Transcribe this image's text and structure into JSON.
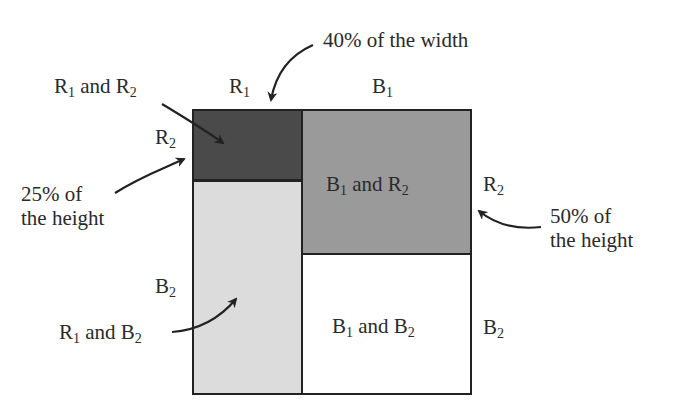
{
  "diagram": {
    "outer_box": {
      "x": 192,
      "y": 109,
      "width": 279,
      "height": 286
    },
    "regions": [
      {
        "id": "r1_r2",
        "label": "",
        "x": 192,
        "y": 109,
        "width": 110,
        "height": 71,
        "fill": "#4a4a4a"
      },
      {
        "id": "r1_b2",
        "label": "",
        "x": 192,
        "y": 180,
        "width": 110,
        "height": 215,
        "fill": "#dcdcdc"
      },
      {
        "id": "b1_r2",
        "label_parts": [
          "B",
          "1",
          " and R",
          "2"
        ],
        "x": 302,
        "y": 109,
        "width": 169,
        "height": 145,
        "fill": "#9a9a9a"
      },
      {
        "id": "b1_b2",
        "label_parts": [
          "B",
          "1",
          " and B",
          "2"
        ],
        "x": 302,
        "y": 254,
        "width": 169,
        "height": 141,
        "fill": "#ffffff"
      }
    ],
    "column_labels": [
      {
        "text": "R",
        "sub": "1"
      },
      {
        "text": "B",
        "sub": "1"
      }
    ],
    "row_labels_left": [
      {
        "text": "R",
        "sub": "2"
      },
      {
        "text": "B",
        "sub": "2"
      }
    ],
    "row_labels_right": [
      {
        "text": "R",
        "sub": "2"
      },
      {
        "text": "B",
        "sub": "2"
      }
    ],
    "callouts": {
      "r1_and_r2": {
        "parts": [
          "R",
          "1",
          " and R",
          "2"
        ]
      },
      "r1_and_b2": {
        "parts": [
          "R",
          "1",
          " and B",
          "2"
        ]
      },
      "width_40": {
        "line1": "40% of the width"
      },
      "height_25": {
        "line1": "25% of",
        "line2": "the height"
      },
      "height_50": {
        "line1": "50% of",
        "line2": "the height"
      }
    },
    "colors": {
      "border": "#222222",
      "dark": "#4a4a4a",
      "medium": "#9a9a9a",
      "light": "#dcdcdc",
      "white": "#ffffff",
      "text": "#2a2a2a"
    }
  }
}
